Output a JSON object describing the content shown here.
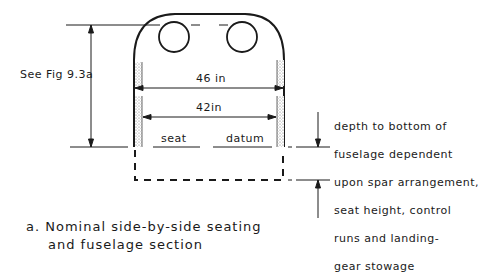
{
  "diagram": {
    "reference_label": "See Fig 9.3a",
    "dimension_outer_width": "46 in",
    "dimension_inner_width": "42in",
    "seat_datum_words": [
      "seat",
      "datum"
    ],
    "depth_note_lines": [
      "depth to bottom of",
      "fuselage dependent",
      "upon spar arrangement,",
      "seat height, control",
      "runs and landing-",
      "gear stowage"
    ],
    "caption_lines": [
      "a. Nominal side-by-side seating",
      "and fuselage section"
    ],
    "colors": {
      "ink": "#1a1a1a",
      "stipple": "#888888",
      "background": "#ffffff"
    }
  }
}
